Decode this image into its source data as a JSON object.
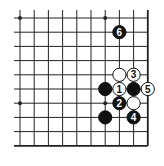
{
  "diagram": {
    "type": "go-board-fragment",
    "columns": 10,
    "rows": 10,
    "open_edges": [
      "top",
      "left"
    ],
    "closed_edges": [
      "right",
      "bottom"
    ],
    "star_points": [
      {
        "col": 0,
        "row": 0
      },
      {
        "col": 6,
        "row": 0
      },
      {
        "col": 0,
        "row": 6
      },
      {
        "col": 6,
        "row": 6
      }
    ],
    "stones": [
      {
        "color": "black",
        "col": 7,
        "row": 1,
        "label": "6"
      },
      {
        "color": "white",
        "col": 7,
        "row": 4,
        "label": ""
      },
      {
        "color": "white",
        "col": 8,
        "row": 4,
        "label": "3"
      },
      {
        "color": "black",
        "col": 6,
        "row": 5,
        "label": ""
      },
      {
        "color": "white",
        "col": 7,
        "row": 5,
        "label": "1"
      },
      {
        "color": "black",
        "col": 8,
        "row": 5,
        "label": ""
      },
      {
        "color": "white",
        "col": 9,
        "row": 5,
        "label": "5"
      },
      {
        "color": "black",
        "col": 7,
        "row": 6,
        "label": "2"
      },
      {
        "color": "white",
        "col": 8,
        "row": 6,
        "label": ""
      },
      {
        "color": "black",
        "col": 6,
        "row": 7,
        "label": ""
      },
      {
        "color": "black",
        "col": 8,
        "row": 7,
        "label": "4"
      }
    ],
    "colors": {
      "line": "#222222",
      "black_stone": "#111111",
      "white_stone": "#ffffff",
      "background": "#ffffff"
    }
  }
}
